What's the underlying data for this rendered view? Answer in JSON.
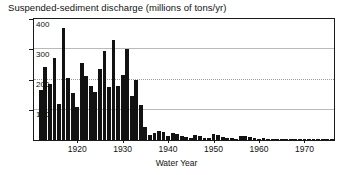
{
  "chart_data": {
    "type": "bar",
    "title": "Suspended-sediment discharge (millions of tons/yr)",
    "xlabel": "Water Year",
    "ylabel": "",
    "xlim": [
      1911,
      1977
    ],
    "ylim": [
      0,
      400
    ],
    "yticks": [
      100,
      200,
      300,
      400
    ],
    "ytick_labels": [
      "100",
      "200",
      "300",
      "400"
    ],
    "xticks": [
      1920,
      1930,
      1940,
      1950,
      1960,
      1970
    ],
    "xtick_labels": [
      "1920",
      "1930",
      "1940",
      "1950",
      "1960",
      "1970"
    ],
    "grid": true,
    "legend": "none",
    "bar_color": "#121212",
    "frame_color": "#1a1a1a",
    "grid_color": "#b9b9b9",
    "x": [
      1912,
      1913,
      1914,
      1915,
      1916,
      1917,
      1918,
      1919,
      1920,
      1921,
      1922,
      1923,
      1924,
      1925,
      1926,
      1927,
      1928,
      1929,
      1930,
      1931,
      1932,
      1933,
      1934,
      1935,
      1936,
      1937,
      1938,
      1939,
      1940,
      1941,
      1942,
      1943,
      1944,
      1945,
      1946,
      1947,
      1948,
      1949,
      1950,
      1951,
      1952,
      1953,
      1954,
      1955,
      1956,
      1957,
      1958,
      1959,
      1960,
      1961,
      1962,
      1963,
      1964,
      1965,
      1966,
      1967,
      1968,
      1969,
      1970,
      1971,
      1972,
      1973,
      1974,
      1975,
      1976
    ],
    "values": [
      165,
      240,
      185,
      270,
      120,
      370,
      205,
      155,
      110,
      255,
      210,
      180,
      160,
      235,
      295,
      175,
      330,
      180,
      215,
      300,
      145,
      200,
      115,
      42,
      18,
      22,
      30,
      26,
      14,
      24,
      20,
      13,
      9,
      8,
      16,
      12,
      6,
      7,
      20,
      17,
      9,
      8,
      6,
      5,
      12,
      14,
      10,
      6,
      5,
      7,
      4,
      2,
      1,
      1,
      1,
      1,
      1,
      1,
      1,
      1,
      1,
      1,
      1,
      1,
      1
    ]
  }
}
